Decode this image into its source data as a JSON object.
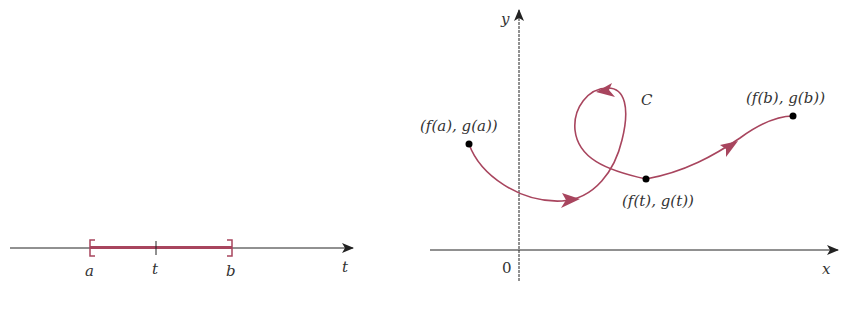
{
  "colors": {
    "curve": "#a8455e",
    "axis": "#222222",
    "point": "#000000",
    "text": "#333333"
  },
  "left_panel": {
    "axis_label": "t",
    "interval_start_label": "a",
    "interval_mid_label": "t",
    "interval_end_label": "b"
  },
  "right_panel": {
    "x_axis_label": "x",
    "y_axis_label": "y",
    "origin_label": "0",
    "curve_label": "C",
    "start_point_label": "(f(a), g(a))",
    "mid_point_label": "(f(t), g(t))",
    "end_point_label": "(f(b), g(b))"
  }
}
